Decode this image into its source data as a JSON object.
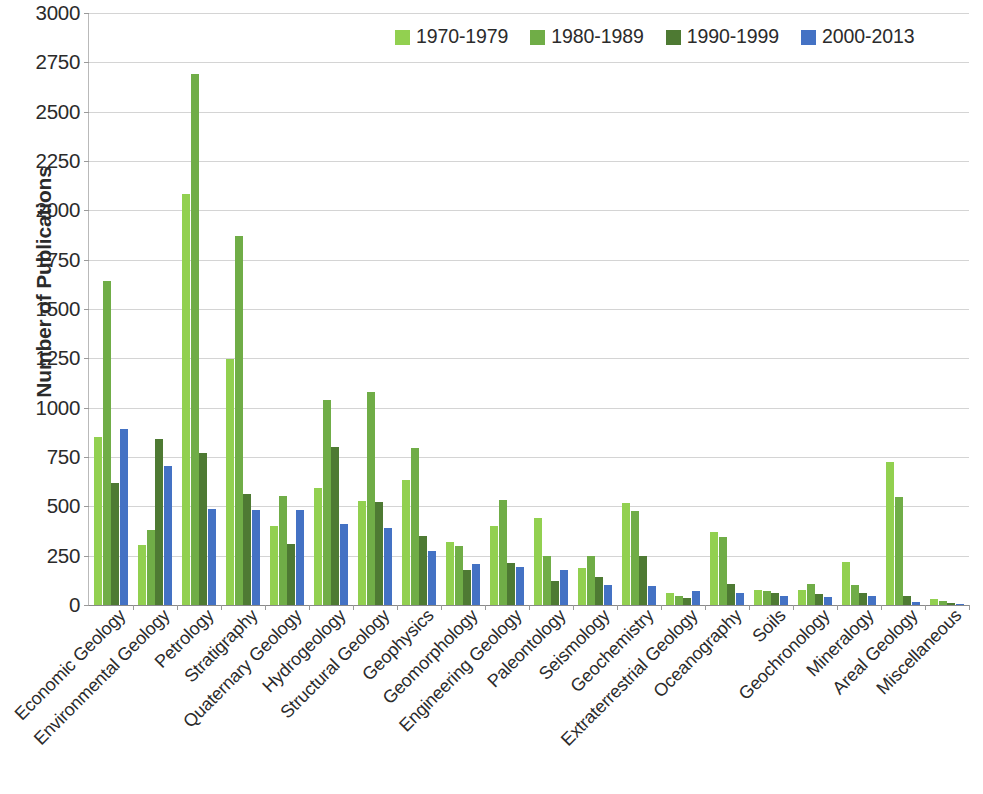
{
  "chart_data": {
    "type": "bar",
    "title": "",
    "subtitle": "",
    "xlabel": "",
    "ylabel": "Number of Publications",
    "ylim": [
      0,
      3000
    ],
    "y_ticks": [
      0,
      250,
      500,
      750,
      1000,
      1250,
      1500,
      1750,
      2000,
      2250,
      2500,
      2750,
      3000
    ],
    "grid": "horizontal",
    "legend_position": "top-right",
    "orientation": "vertical",
    "grouping": "clustered",
    "categories": [
      "Economic Geology",
      "Environmental Geology",
      "Petrology",
      "Stratigraphy",
      "Quaternary Geology",
      "Hydrogeology",
      "Structural Geology",
      "Geophysics",
      "Geomorphology",
      "Engineering Geology",
      "Paleontology",
      "Seismology",
      "Geochemistry",
      "Extraterrestrial Geology",
      "Oceanography",
      "Soils",
      "Geochronology",
      "Mineralogy",
      "Areal Geology",
      "Miscellaneous"
    ],
    "series": [
      {
        "name": "1970-1979",
        "color": "#92D050",
        "values": [
          850,
          305,
          2085,
          1245,
          400,
          595,
          525,
          635,
          320,
          400,
          440,
          190,
          515,
          60,
          370,
          75,
          75,
          220,
          725,
          30
        ]
      },
      {
        "name": "1980-1989",
        "color": "#70AD47",
        "values": [
          1640,
          380,
          2690,
          1870,
          550,
          1040,
          1080,
          795,
          300,
          530,
          250,
          250,
          475,
          45,
          345,
          70,
          105,
          100,
          545,
          18
        ]
      },
      {
        "name": "1990-1999",
        "color": "#4E7A33",
        "values": [
          620,
          840,
          770,
          565,
          310,
          800,
          520,
          350,
          175,
          215,
          120,
          140,
          250,
          35,
          105,
          60,
          55,
          60,
          45,
          8
        ]
      },
      {
        "name": "2000-2013",
        "color": "#4472C4",
        "values": [
          890,
          705,
          485,
          480,
          480,
          410,
          390,
          275,
          210,
          195,
          175,
          100,
          95,
          70,
          60,
          45,
          40,
          45,
          15,
          5
        ]
      }
    ]
  },
  "legend": {
    "entries": [
      {
        "label": "1970-1979",
        "color": "#92D050"
      },
      {
        "label": "1980-1989",
        "color": "#70AD47"
      },
      {
        "label": "1990-1999",
        "color": "#4E7A33"
      },
      {
        "label": "2000-2013",
        "color": "#4472C4"
      }
    ]
  },
  "axes": {
    "y_title": "Number of Publications"
  }
}
